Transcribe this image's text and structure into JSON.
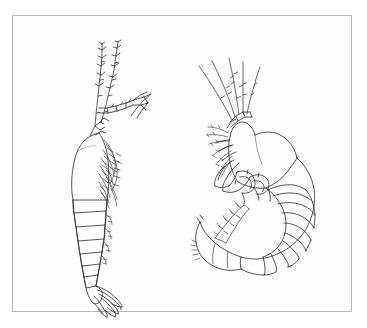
{
  "image": {
    "kind": "scientific-line-drawing",
    "title": "Two crustacean specimens, lateral view",
    "background_color": "#ffffff",
    "ink_color": "#2b2b2b",
    "frame": {
      "border_color": "#b8b8b8",
      "border_width_px": 1,
      "x": 12,
      "y": 15,
      "width": 340,
      "height": 297
    },
    "width_px": 367,
    "height_px": 328,
    "labels": [],
    "caption_text": "",
    "scale_bar_text": ""
  },
  "specimens": [
    {
      "id": "left-specimen",
      "name": "Elongate crustacean, left figure",
      "posture": "straight, head up, tail down",
      "orientation": "head at top, abdomen descending, appendages facing right",
      "features": [
        "ovoid carapace / cephalothorax",
        "two long segmented antennal flagella with setae",
        "segmented antennule directed right with terminal spines",
        "dense cluster of thoracic pereopods with setae",
        "about nine segmented pleon rings",
        "terminal telson with elongate uropod blades"
      ],
      "segment_count": 9,
      "uropod_blade_count": 4
    },
    {
      "id": "right-specimen",
      "name": "Curved crustacean, right figure",
      "posture": "strongly curved C-shape, ventral side left",
      "orientation": "head at upper left, body curving clockwise to posterior at lower left",
      "features": [
        "broad shield-like carapace",
        "multiple antennal flagella directed upper-left",
        "robust gnathopods and pereopods clustered anteriorly",
        "fan of radiating segmented pleon plates",
        "rounded posterior with setose appendage"
      ],
      "segment_count": 11,
      "fan_ray_count": 10
    }
  ]
}
